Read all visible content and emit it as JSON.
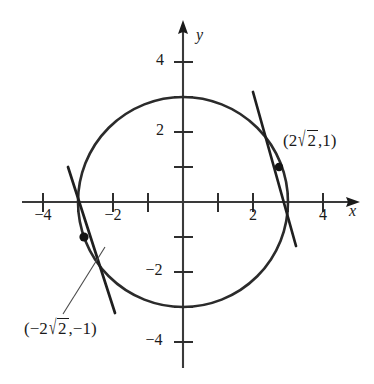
{
  "figure": {
    "axes": {
      "x_axis_name": "x",
      "y_axis_name": "y",
      "origin_px": [
        183,
        202
      ],
      "unit_px": 35,
      "x_range": [
        -4.6,
        4.8
      ],
      "y_range": [
        -4.7,
        4.6
      ],
      "x_tick_values": [
        -4,
        -3,
        -2,
        -1,
        1,
        2,
        3,
        4
      ],
      "y_tick_values": [
        4,
        3,
        2,
        1,
        -1,
        -2,
        -3,
        -4
      ],
      "x_tick_labels": [
        {
          "value": -4,
          "text": "−4"
        },
        {
          "value": -2,
          "text": "−2"
        },
        {
          "value": 2,
          "text": "2"
        },
        {
          "value": 4,
          "text": "4"
        }
      ],
      "y_tick_labels": [
        {
          "value": 4,
          "text": "4"
        },
        {
          "value": 2,
          "text": "2"
        },
        {
          "value": -2,
          "text": "−2"
        },
        {
          "value": -4,
          "text": "−4"
        }
      ]
    },
    "circle": {
      "center": [
        0,
        0
      ],
      "radius": 3,
      "equation": "x² + y² = 9"
    },
    "tangent_lines": [
      {
        "name": "upper-right-tangent",
        "point_of_tangency": [
          2.828,
          1
        ],
        "slope": -2.828,
        "x_span": [
          2.0,
          3.2
        ]
      },
      {
        "name": "lower-left-tangent",
        "point_of_tangency": [
          -2.828,
          -1
        ],
        "slope": -2.828,
        "x_span": [
          -3.3,
          -2.1
        ]
      }
    ],
    "points": [
      {
        "name": "upper-right-point",
        "coords": [
          2.828,
          1
        ],
        "label_prefix": "(2",
        "label_radicand": "2",
        "label_suffix": ",1)"
      },
      {
        "name": "lower-left-point",
        "coords": [
          -2.828,
          -1
        ],
        "label_prefix": "(−2",
        "label_radicand": "2",
        "label_suffix": ",−1)"
      }
    ],
    "radical_sign": "√",
    "leader_line": {
      "from_px": [
        68,
        312
      ],
      "to_px": [
        108,
        248
      ]
    },
    "colors": {
      "ink": "#1a1a1a",
      "curve": "#2b2b2b",
      "background": "#ffffff"
    }
  }
}
